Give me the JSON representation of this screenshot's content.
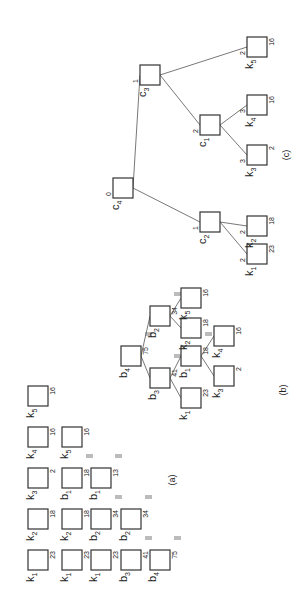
{
  "figure": {
    "orientation": "rotated-90-ccw",
    "panel_labels": {
      "a": "(a)",
      "b": "(b)",
      "c": "(c)"
    },
    "panel_a": {
      "rows": [
        [
          {
            "name": "k",
            "sub": "1",
            "val": "23",
            "marks": 0
          },
          {
            "name": "k",
            "sub": "2",
            "val": "18",
            "marks": 0
          },
          {
            "name": "k",
            "sub": "3",
            "val": "2",
            "marks": 0
          },
          {
            "name": "k",
            "sub": "4",
            "val": "16",
            "marks": 0
          },
          {
            "name": "k",
            "sub": "5",
            "val": "16",
            "marks": 0
          }
        ],
        [
          {
            "name": "k",
            "sub": "1",
            "val": "23",
            "marks": 0
          },
          {
            "name": "k",
            "sub": "2",
            "val": "18",
            "marks": 0
          },
          {
            "name": "b",
            "sub": "1",
            "val": "18",
            "marks": 2
          },
          {
            "name": "k",
            "sub": "5",
            "val": "16",
            "marks": 0
          }
        ],
        [
          {
            "name": "k",
            "sub": "1",
            "val": "23",
            "marks": 0
          },
          {
            "name": "b",
            "sub": "2",
            "val": "34",
            "marks": 2
          },
          {
            "name": "b",
            "sub": "1",
            "val": "13",
            "marks": 2
          }
        ],
        [
          {
            "name": "b",
            "sub": "3",
            "val": "41",
            "marks": 2
          },
          {
            "name": "b",
            "sub": "2",
            "val": "34",
            "marks": 2
          }
        ],
        [
          {
            "name": "b",
            "sub": "4",
            "val": "75",
            "marks": 2
          }
        ]
      ]
    },
    "panel_b": {
      "nodes": [
        {
          "id": "b4",
          "name": "b",
          "sub": "4",
          "val": "75",
          "marks": 2
        },
        {
          "id": "b3",
          "name": "b",
          "sub": "3",
          "val": "41",
          "marks": 2
        },
        {
          "id": "b2",
          "name": "b",
          "sub": "2",
          "val": "34",
          "marks": 2
        },
        {
          "id": "k1",
          "name": "k",
          "sub": "1",
          "val": "23",
          "marks": 0
        },
        {
          "id": "b1",
          "name": "b",
          "sub": "1",
          "val": "18",
          "marks": 2
        },
        {
          "id": "k2",
          "name": "k",
          "sub": "2",
          "val": "18",
          "marks": 0
        },
        {
          "id": "k5",
          "name": "k",
          "sub": "5",
          "val": "16",
          "marks": 0
        },
        {
          "id": "k3",
          "name": "k",
          "sub": "3",
          "val": "2",
          "marks": 0
        },
        {
          "id": "k4",
          "name": "k",
          "sub": "4",
          "val": "16",
          "marks": 0
        }
      ],
      "edges": [
        [
          "b4",
          "b3"
        ],
        [
          "b4",
          "b2"
        ],
        [
          "b3",
          "k1"
        ],
        [
          "b3",
          "b1"
        ],
        [
          "b1",
          "k3"
        ],
        [
          "b1",
          "k4"
        ],
        [
          "b2",
          "k2"
        ],
        [
          "b2",
          "k5"
        ]
      ]
    },
    "panel_c": {
      "nodes": [
        {
          "id": "c4",
          "name": "c",
          "sub": "4",
          "val": "",
          "depth": "0"
        },
        {
          "id": "c2",
          "name": "c",
          "sub": "2",
          "val": "",
          "depth": "1"
        },
        {
          "id": "c3",
          "name": "c",
          "sub": "3",
          "val": "",
          "depth": "1"
        },
        {
          "id": "k1",
          "name": "k",
          "sub": "1",
          "val": "23",
          "depth": "2"
        },
        {
          "id": "k2",
          "name": "k",
          "sub": "2",
          "val": "18",
          "depth": "2"
        },
        {
          "id": "c1",
          "name": "c",
          "sub": "1",
          "val": "",
          "depth": "2"
        },
        {
          "id": "k5",
          "name": "k",
          "sub": "5",
          "val": "16",
          "depth": "2"
        },
        {
          "id": "k3",
          "name": "k",
          "sub": "3",
          "val": "2",
          "depth": "3"
        },
        {
          "id": "k4",
          "name": "k",
          "sub": "4",
          "val": "16",
          "depth": "3"
        }
      ],
      "edges": [
        [
          "c4",
          "c2"
        ],
        [
          "c4",
          "c3"
        ],
        [
          "c2",
          "k1"
        ],
        [
          "c2",
          "k2"
        ],
        [
          "c3",
          "c1"
        ],
        [
          "c3",
          "k5"
        ],
        [
          "c1",
          "k3"
        ],
        [
          "c1",
          "k4"
        ]
      ]
    }
  }
}
